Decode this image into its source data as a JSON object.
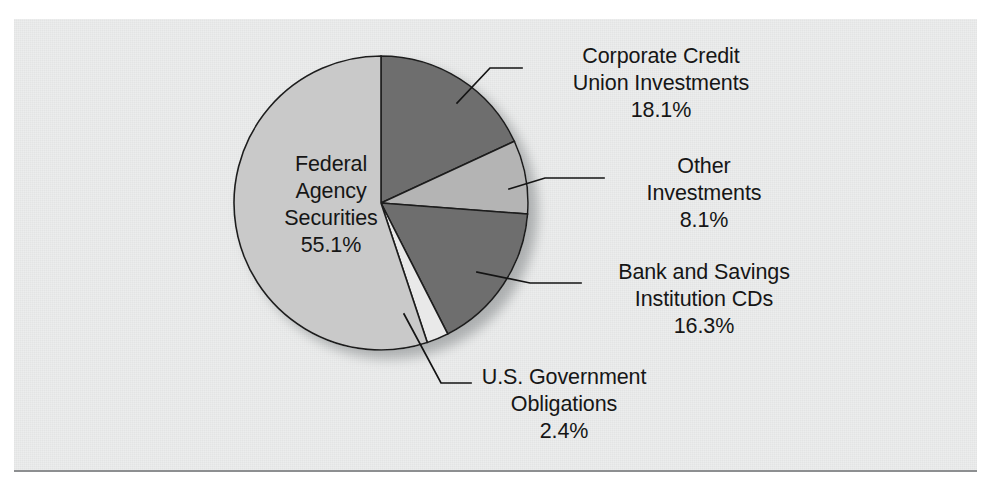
{
  "figure": {
    "background_color": "#ffffff",
    "paper_color": "#eceded",
    "rule_color": "#8d8f91"
  },
  "chart_data": {
    "type": "pie",
    "title": "",
    "subtitle": "",
    "xlabel": "",
    "ylabel": "",
    "legend_position": "none",
    "grid": false,
    "start_angle_deg": 0,
    "direction": "clockwise",
    "units": "percent",
    "total": 100.0,
    "categories": [
      "Corporate Credit Union Investments",
      "Other Investments",
      "Bank and Savings Institution CDs",
      "U.S. Government Obligations",
      "Federal Agency Securities"
    ],
    "values": [
      18.1,
      8.1,
      16.3,
      2.4,
      55.1
    ],
    "slices": [
      {
        "name": "corporate-credit-union-investments",
        "label_line1": "Corporate Credit",
        "label_line2": "Union Investments",
        "value_text": "18.1%",
        "value": 18.1,
        "color": "#6e6e6e",
        "label_placement": "outside-right"
      },
      {
        "name": "other-investments",
        "label_line1": "Other",
        "label_line2": "Investments",
        "value_text": "8.1%",
        "value": 8.1,
        "color": "#b4b4b4",
        "label_placement": "outside-right"
      },
      {
        "name": "bank-and-savings-institution-cds",
        "label_line1": "Bank and Savings",
        "label_line2": "Institution CDs",
        "value_text": "16.3%",
        "value": 16.3,
        "color": "#6e6e6e",
        "label_placement": "outside-right"
      },
      {
        "name": "us-government-obligations",
        "label_line1": "U.S. Government",
        "label_line2": "Obligations",
        "value_text": "2.4%",
        "value": 2.4,
        "color": "#e9e9e9",
        "label_placement": "outside-bottom"
      },
      {
        "name": "federal-agency-securities",
        "label_line1": "Federal",
        "label_line2": "Agency",
        "label_line3": "Securities",
        "value_text": "55.1%",
        "value": 55.1,
        "color": "#c9c9c9",
        "label_placement": "inside"
      }
    ]
  }
}
